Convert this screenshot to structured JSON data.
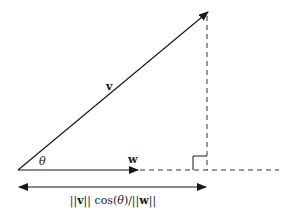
{
  "diagram": {
    "colors": {
      "stroke": "#1a1a1a",
      "dashed": "#333333",
      "background": "#ffffff"
    },
    "labels": {
      "v": "v",
      "w": "w",
      "theta": "θ",
      "projection_pre": "||",
      "projection_v": "v",
      "projection_mid": "|| cos(",
      "projection_theta": "θ",
      "projection_post": ")/||",
      "projection_w": "w",
      "projection_end": "||"
    },
    "elements": [
      {
        "type": "arrow",
        "name": "vector-v",
        "from": [
          18,
          170
        ],
        "to": [
          208,
          12
        ]
      },
      {
        "type": "arrow",
        "name": "vector-w",
        "from": [
          18,
          170
        ],
        "to": [
          138,
          170
        ]
      },
      {
        "type": "dashed-line",
        "name": "perpendicular-drop",
        "from": [
          207,
          14
        ],
        "to": [
          207,
          170
        ]
      },
      {
        "type": "dashed-line",
        "name": "w-extension",
        "from": [
          138,
          170
        ],
        "to": [
          278,
          170
        ]
      },
      {
        "type": "right-angle",
        "name": "right-angle-marker",
        "at": [
          207,
          170
        ],
        "size": 14
      },
      {
        "type": "double-arrow",
        "name": "projection-length",
        "from": [
          18,
          187
        ],
        "to": [
          207,
          187
        ]
      }
    ]
  }
}
